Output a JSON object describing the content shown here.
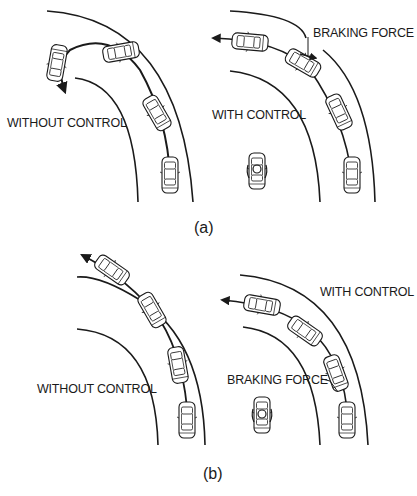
{
  "figure": {
    "panel_a": {
      "caption": "(a)",
      "left_label": "WITHOUT CONTROL",
      "right_label": "WITH CONTROL",
      "force_label": "BRAKING FORCE"
    },
    "panel_b": {
      "caption": "(b)",
      "left_label": "WITHOUT CONTROL",
      "right_label": "WITH CONTROL",
      "force_label": "BRAKING FORCE"
    }
  },
  "colors": {
    "ink": "#1a1a1a",
    "background": "#ffffff"
  }
}
